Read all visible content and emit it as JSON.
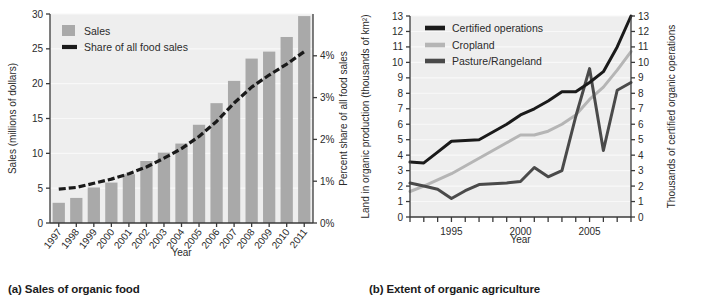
{
  "figure": {
    "panels": [
      {
        "id": "a",
        "caption": "(a) Sales of organic food",
        "xlabel": "Year",
        "ylabel_left": "Sales (millions of dollars)",
        "ylabel_right": "Percent share of all food sales"
      },
      {
        "id": "b",
        "caption": "(b) Extent of organic agriculture",
        "xlabel": "Year",
        "ylabel_left": "Land in organic production (thousands of km²)",
        "ylabel_right": "Thousands of certified organic operations"
      }
    ]
  },
  "colors": {
    "plot_background": "#eeeeee",
    "gridline": "#f8f8f8",
    "axis": "#3a3a3a",
    "bar_fill": "#a9a9a9",
    "series_black": "#1a1a1a",
    "series_light_gray": "#b5b5b5",
    "series_dark_gray": "#4a4a4a",
    "text": "#2b2b2b"
  },
  "chart_data": [
    {
      "type": "bar",
      "id": "sales-of-organic-food",
      "title": "(a) Sales of organic food",
      "xlabel": "Year",
      "ylabel": "Sales (millions of dollars)",
      "ylabel_right": "Percent share of all food sales",
      "grid": true,
      "legend_position": "top-left",
      "categories": [
        "1997",
        "1998",
        "1999",
        "2000",
        "2001",
        "2002",
        "2003",
        "2004",
        "2005",
        "2006",
        "2007",
        "2008",
        "2009",
        "2010",
        "2011"
      ],
      "ylim": [
        0,
        30
      ],
      "yticks": [
        0,
        5,
        10,
        15,
        20,
        25,
        30
      ],
      "ylim_right": [
        0,
        5
      ],
      "yticks_right": [
        0,
        1,
        2,
        3,
        4
      ],
      "yticklabels_right": [
        "0%",
        "1%",
        "2%",
        "3%",
        "4%"
      ],
      "series": [
        {
          "name": "Sales",
          "kind": "bar",
          "color": "#a9a9a9",
          "axis": "left",
          "values": [
            2.9,
            3.6,
            5.1,
            5.8,
            7.0,
            8.9,
            10.1,
            11.4,
            14.1,
            17.2,
            20.4,
            23.6,
            24.6,
            26.7,
            29.7
          ]
        },
        {
          "name": "Share of all food sales",
          "kind": "line-dashed",
          "color": "#1a1a1a",
          "axis": "right",
          "values": [
            0.81,
            0.85,
            0.95,
            1.05,
            1.18,
            1.34,
            1.55,
            1.78,
            2.07,
            2.43,
            2.87,
            3.25,
            3.54,
            3.8,
            4.1
          ]
        }
      ],
      "legend": [
        "Sales",
        "Share of all food sales"
      ]
    },
    {
      "type": "line",
      "id": "extent-of-organic-agriculture",
      "title": "(b) Extent of organic agriculture",
      "xlabel": "Year",
      "ylabel": "Land in organic production (thousands of km²)",
      "ylabel_right": "Thousands of certified organic operations",
      "grid": true,
      "legend_position": "top-left",
      "xlim": [
        1992,
        2008
      ],
      "xticks": [
        1992,
        1993,
        1994,
        1995,
        1996,
        1997,
        1998,
        1999,
        2000,
        2001,
        2002,
        2003,
        2004,
        2005,
        2006,
        2007,
        2008
      ],
      "xticklabels_shown": {
        "1995": "1995",
        "2000": "2000",
        "2005": "2005"
      },
      "ylim": [
        0,
        13
      ],
      "yticks": [
        0,
        1,
        2,
        3,
        4,
        5,
        6,
        7,
        8,
        9,
        10,
        11,
        12,
        13
      ],
      "ylim_right": [
        0,
        13
      ],
      "yticks_right": [
        0,
        1,
        2,
        3,
        4,
        5,
        6,
        7,
        8,
        9,
        10,
        11,
        12,
        13
      ],
      "x": [
        1992,
        1993,
        1994,
        1995,
        1996,
        1997,
        1998,
        1999,
        2000,
        2001,
        2002,
        2003,
        2004,
        2005,
        2006,
        2007,
        2008
      ],
      "series": [
        {
          "name": "Certified operations",
          "color": "#1a1a1a",
          "axis": "right",
          "values": [
            3.55,
            3.5,
            4.2,
            4.9,
            4.95,
            5.0,
            5.5,
            6.0,
            6.6,
            7.0,
            7.5,
            8.1,
            8.1,
            8.7,
            9.4,
            11.0,
            13.0
          ]
        },
        {
          "name": "Cropland",
          "color": "#b5b5b5",
          "axis": "left",
          "values": [
            1.65,
            2.0,
            2.4,
            2.8,
            3.3,
            3.8,
            4.3,
            4.8,
            5.3,
            5.3,
            5.55,
            6.0,
            6.6,
            7.6,
            8.4,
            9.5,
            10.7
          ]
        },
        {
          "name": "Pasture/Rangeland",
          "color": "#4a4a4a",
          "axis": "left",
          "values": [
            2.2,
            2.0,
            1.8,
            1.2,
            1.7,
            2.1,
            2.15,
            2.2,
            2.3,
            3.2,
            2.6,
            3.0,
            6.5,
            9.6,
            4.3,
            8.2,
            8.7
          ]
        }
      ],
      "legend": [
        "Certified operations",
        "Cropland",
        "Pasture/Rangeland"
      ]
    }
  ]
}
